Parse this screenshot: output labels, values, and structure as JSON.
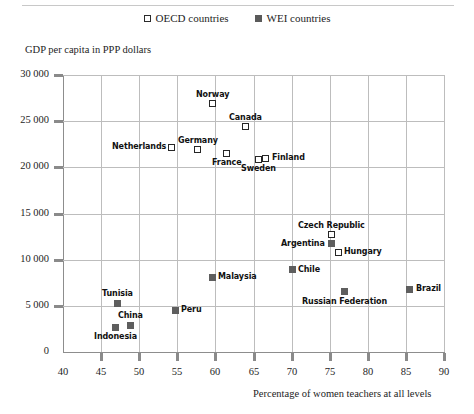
{
  "legend": {
    "entries": [
      {
        "label": "OECD countries",
        "marker": "open-square-icon",
        "series": "OECD"
      },
      {
        "label": "WEI countries",
        "marker": "filled-square-icon",
        "series": "WEI"
      }
    ]
  },
  "chart_data": {
    "type": "scatter",
    "title": "",
    "xlabel": "Percentage of women teachers at all levels",
    "ylabel": "GDP per capita in PPP dollars",
    "xlim": [
      40,
      90
    ],
    "ylim": [
      0,
      30000
    ],
    "xticks": [
      "40",
      "45",
      "50",
      "55",
      "60",
      "65",
      "70",
      "75",
      "80",
      "85",
      "90"
    ],
    "yticks": [
      "0",
      "5 000",
      "10 000",
      "15 000",
      "20 000",
      "25 000",
      "30 000"
    ],
    "grid": true,
    "legend_position": "top-center",
    "series": [
      {
        "name": "OECD countries",
        "marker": "open-square",
        "points": [
          {
            "label": "Norway",
            "x": 59.6,
            "y": 26900,
            "label_pos": "top"
          },
          {
            "label": "Canada",
            "x": 63.9,
            "y": 24400,
            "label_pos": "top"
          },
          {
            "label": "Netherlands",
            "x": 54.3,
            "y": 22200,
            "label_pos": "left"
          },
          {
            "label": "Germany",
            "x": 57.7,
            "y": 21900,
            "label_pos": "top"
          },
          {
            "label": "France",
            "x": 61.5,
            "y": 21500,
            "label_pos": "bottom"
          },
          {
            "label": "Sweden",
            "x": 65.7,
            "y": 20900,
            "label_pos": "bottom"
          },
          {
            "label": "Finland",
            "x": 66.6,
            "y": 21000,
            "label_pos": "right"
          },
          {
            "label": "Czech Republic",
            "x": 75.2,
            "y": 12700,
            "label_pos": "top"
          },
          {
            "label": "Hungary",
            "x": 76.1,
            "y": 10800,
            "label_pos": "right"
          }
        ]
      },
      {
        "name": "WEI countries",
        "marker": "filled-square",
        "points": [
          {
            "label": "Argentina",
            "x": 75.2,
            "y": 11700,
            "label_pos": "left"
          },
          {
            "label": "Chile",
            "x": 70.1,
            "y": 8900,
            "label_pos": "right"
          },
          {
            "label": "Malaysia",
            "x": 59.6,
            "y": 8100,
            "label_pos": "right"
          },
          {
            "label": "Brazil",
            "x": 85.5,
            "y": 6800,
            "label_pos": "right"
          },
          {
            "label": "Russian Federation",
            "x": 76.9,
            "y": 6500,
            "label_pos": "bottom"
          },
          {
            "label": "Tunisia",
            "x": 47.1,
            "y": 5300,
            "label_pos": "top"
          },
          {
            "label": "Peru",
            "x": 54.7,
            "y": 4500,
            "label_pos": "right"
          },
          {
            "label": "China",
            "x": 48.8,
            "y": 2900,
            "label_pos": "top"
          },
          {
            "label": "Indonesia",
            "x": 46.9,
            "y": 2700,
            "label_pos": "bottom"
          }
        ]
      }
    ]
  }
}
